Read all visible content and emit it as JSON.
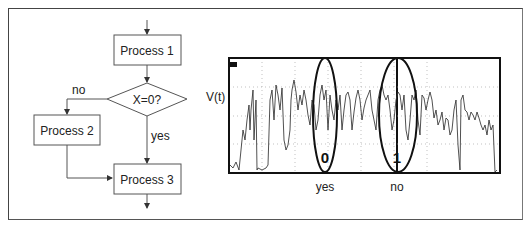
{
  "flowchart": {
    "process1": "Process 1",
    "decision": "X=0?",
    "no_label": "no",
    "yes_label": "yes",
    "process2": "Process 2",
    "process3": "Process 3"
  },
  "scope": {
    "y_label": "V(t)",
    "channel_marker": "1",
    "highlight_0": "0",
    "highlight_1": "1",
    "caption_yes": "yes",
    "caption_no": "no"
  }
}
